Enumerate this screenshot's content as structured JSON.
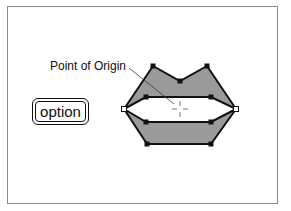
{
  "diagram": {
    "label_point_of_origin": "Point of Origin",
    "key_label": "option",
    "colors": {
      "fill": "#9a9a9a",
      "stroke": "#111111",
      "frame": "#8a8a8a"
    },
    "shape": "lips-polygon-with-handles"
  }
}
